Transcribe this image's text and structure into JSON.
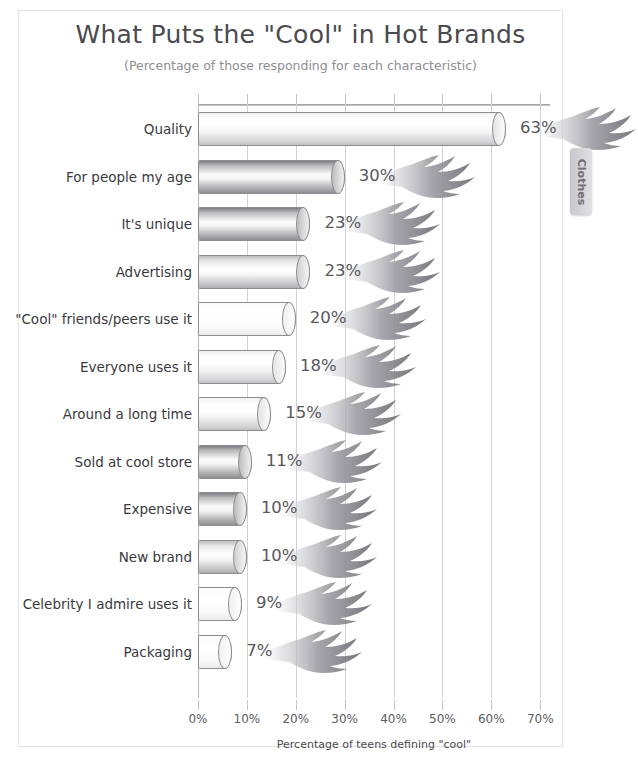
{
  "chart_data": {
    "type": "bar",
    "orientation": "horizontal",
    "title": "What Puts the \"Cool\" in Hot Brands",
    "subtitle": "(Percentage of those responding for each characteristic)",
    "xlabel": "Percentage of teens defining \"cool\"",
    "ylabel": "",
    "xlim": [
      0,
      70
    ],
    "grid": true,
    "legend": "none",
    "categories": [
      "Quality",
      "For people my age",
      "It's unique",
      "Advertising",
      "\"Cool\" friends/peers use it",
      "Everyone uses it",
      "Around a long time",
      "Sold at cool store",
      "Expensive",
      "New brand",
      "Celebrity I admire uses it",
      "Packaging"
    ],
    "values": [
      63,
      30,
      23,
      23,
      20,
      18,
      15,
      11,
      10,
      10,
      9,
      7
    ],
    "value_labels": [
      "63%",
      "30%",
      "23%",
      "23%",
      "20%",
      "18%",
      "15%",
      "11%",
      "10%",
      "10%",
      "9%",
      "7%"
    ],
    "xticks": [
      0,
      10,
      20,
      30,
      40,
      50,
      60,
      70
    ],
    "xtick_labels": [
      "0%",
      "10%",
      "20%",
      "30%",
      "40%",
      "50%",
      "60%",
      "70%"
    ],
    "bar_shading": [
      "light",
      "dark",
      "dark",
      "mid",
      "flat",
      "light",
      "light",
      "dark",
      "dark",
      "mid",
      "flat",
      "flat"
    ]
  },
  "side_tab": {
    "label": "Clothes"
  },
  "colors": {
    "title_text": "#4a4a4f",
    "subtitle_text": "#8e8e93",
    "category_text": "#3a3a3e",
    "value_text": "#58585d",
    "gridline": "#d2d2d6",
    "bar_outline": "#8d8d91",
    "flame": "#9a9aa0",
    "frame_border": "#e3e3e3",
    "side_tab": "#c8c8cc",
    "background": "#ffffff"
  }
}
